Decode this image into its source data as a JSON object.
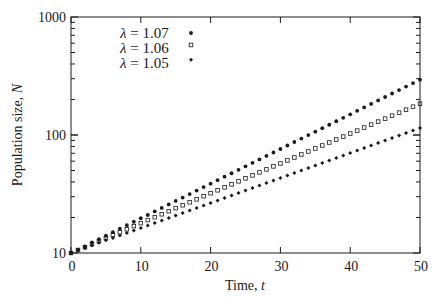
{
  "chart_data": {
    "type": "scatter",
    "title": "",
    "xlabel": "Time, ",
    "xlabel_var": "t",
    "ylabel": "Population size, ",
    "ylabel_var": "N",
    "xlim": [
      0,
      50
    ],
    "ylim": [
      10,
      1000
    ],
    "yscale": "log",
    "grid": false,
    "legend_position": "upper-left-center",
    "x_ticks": [
      0,
      10,
      20,
      30,
      40,
      50
    ],
    "x_tick_labels": [
      "0",
      "10",
      "20",
      "30",
      "40",
      "50"
    ],
    "y_ticks": [
      10,
      100,
      1000
    ],
    "y_tick_labels": [
      "10",
      "100",
      "1000"
    ],
    "x": [
      0,
      1,
      2,
      3,
      4,
      5,
      6,
      7,
      8,
      9,
      10,
      11,
      12,
      13,
      14,
      15,
      16,
      17,
      18,
      19,
      20,
      21,
      22,
      23,
      24,
      25,
      26,
      27,
      28,
      29,
      30,
      31,
      32,
      33,
      34,
      35,
      36,
      37,
      38,
      39,
      40,
      41,
      42,
      43,
      44,
      45,
      46,
      47,
      48,
      49,
      50
    ],
    "series": [
      {
        "name": "λ = 1.07",
        "marker": "filled-circle",
        "values": [
          10.0,
          10.7,
          11.4,
          12.3,
          13.1,
          14.0,
          15.0,
          16.1,
          17.2,
          18.4,
          19.7,
          21.0,
          22.5,
          24.1,
          25.8,
          27.6,
          29.5,
          31.6,
          33.8,
          36.2,
          38.7,
          41.4,
          44.3,
          47.4,
          50.7,
          54.3,
          58.1,
          62.1,
          66.5,
          71.1,
          76.1,
          81.5,
          87.2,
          93.3,
          99.8,
          106.8,
          114.2,
          122.2,
          130.8,
          139.9,
          149.7,
          160.2,
          171.4,
          183.4,
          196.3,
          210.0,
          224.7,
          240.5,
          257.3,
          275.3,
          294.6
        ]
      },
      {
        "name": "λ = 1.06",
        "marker": "open-square",
        "values": [
          10.0,
          10.6,
          11.2,
          11.9,
          12.6,
          13.4,
          14.2,
          15.0,
          15.9,
          16.9,
          17.9,
          19.0,
          20.1,
          21.3,
          22.6,
          24.0,
          25.4,
          26.9,
          28.5,
          30.3,
          32.1,
          34.0,
          36.0,
          38.2,
          40.5,
          42.9,
          45.5,
          48.2,
          51.1,
          54.2,
          57.4,
          60.9,
          64.5,
          68.4,
          72.5,
          76.9,
          81.5,
          86.4,
          91.5,
          97.0,
          102.9,
          109.0,
          115.6,
          122.5,
          129.9,
          137.6,
          145.9,
          154.7,
          163.9,
          173.8,
          184.2
        ]
      },
      {
        "name": "λ = 1.05",
        "marker": "filled-diamond",
        "values": [
          10.0,
          10.5,
          11.0,
          11.6,
          12.2,
          12.8,
          13.4,
          14.1,
          14.8,
          15.5,
          16.3,
          17.1,
          18.0,
          18.9,
          19.8,
          20.8,
          21.8,
          22.9,
          24.1,
          25.3,
          26.5,
          27.9,
          29.3,
          30.7,
          32.3,
          33.9,
          35.6,
          37.3,
          39.2,
          41.2,
          43.2,
          45.4,
          47.6,
          50.0,
          52.5,
          55.2,
          57.9,
          60.8,
          63.9,
          67.0,
          70.4,
          73.9,
          77.6,
          81.5,
          85.6,
          89.9,
          94.3,
          99.1,
          104.0,
          109.2,
          114.7
        ]
      }
    ]
  },
  "legend": {
    "items": [
      {
        "symbol": "λ",
        "text": " = 1.07"
      },
      {
        "symbol": "λ",
        "text": " = 1.06"
      },
      {
        "symbol": "λ",
        "text": " = 1.05"
      }
    ]
  },
  "colors": {
    "ink": "#1a1a1a",
    "background": "#ffffff"
  }
}
